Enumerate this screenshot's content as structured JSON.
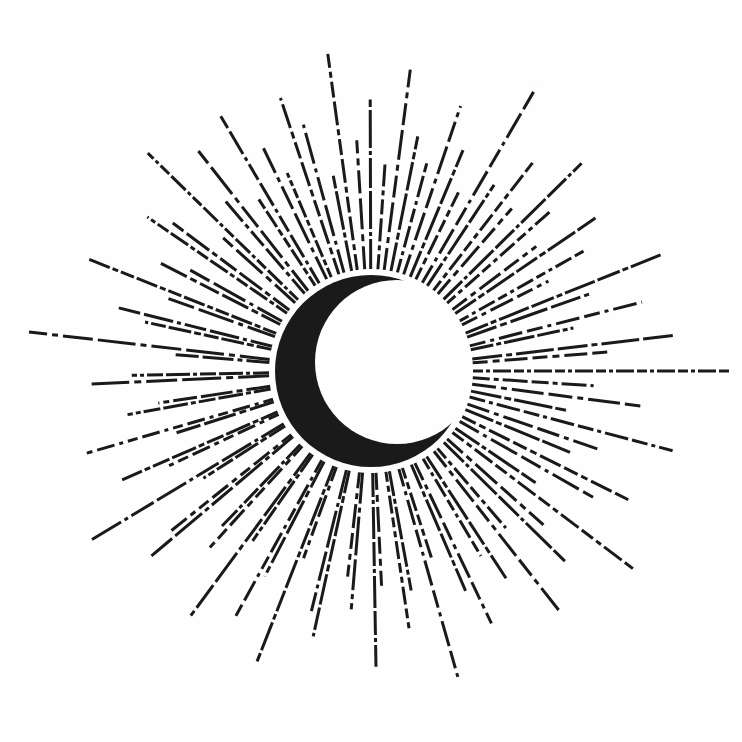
{
  "illustration": {
    "subject": "crescent moon with radiating dashed sun rays",
    "background": "#fefefe",
    "ink": "#1a1a1a",
    "center": [
      371,
      371
    ],
    "moon": {
      "outer_radius": 96,
      "cut_center": [
        397,
        362
      ],
      "cut_radius": 82
    },
    "rays": {
      "count": 96,
      "inner_radius": 102,
      "lengths": [
        320,
        150,
        210,
        120,
        260,
        170,
        140,
        230,
        190,
        120,
        280,
        160,
        210,
        130,
        250,
        180,
        140,
        220,
        170,
        120,
        270,
        150,
        200,
        140,
        240,
        170,
        130,
        210,
        180,
        120,
        260,
        160,
        220,
        130,
        250,
        170,
        140,
        230,
        190,
        120,
        280,
        150,
        210,
        130,
        240,
        180,
        140,
        220,
        170,
        120,
        300,
        160,
        200,
        140,
        250,
        170,
        130,
        210,
        180,
        120,
        260,
        150,
        220,
        130,
        240,
        180,
        140,
        230,
        190,
        120,
        270,
        160,
        210,
        130,
        250,
        170,
        140,
        220,
        170,
        120,
        280,
        150,
        200,
        140,
        240,
        170,
        130,
        210,
        180,
        120,
        260,
        160,
        220,
        130,
        250,
        170
      ]
    }
  }
}
